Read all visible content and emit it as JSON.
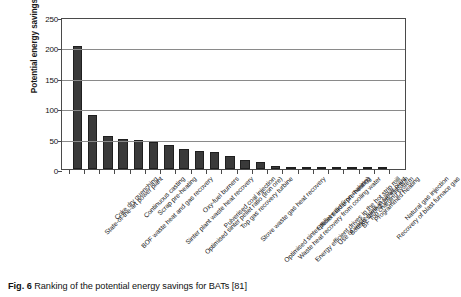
{
  "caption": {
    "figure_number": "Fig. 6",
    "text": "Ranking of the potential energy savings for BATs [81]"
  },
  "chart_data": {
    "type": "bar",
    "title": "",
    "xlabel": "",
    "ylabel": "Potential energy savings, PJ",
    "ylim": [
      0,
      250
    ],
    "yticks": [
      0,
      50,
      100,
      150,
      200,
      250
    ],
    "grid": true,
    "legend": false,
    "bar_color": "#3a3a3a",
    "categories": [
      "State-of-the-art power plant",
      "Coke dry quenching",
      "BOF waste heat and gas recovery",
      "Continuous casting",
      "Scrap pre-heating",
      "Sinter plant waste heat recovery",
      "Optimised sinter pellet ratio (iron ore)",
      "Oxy-fuel burners",
      "Pulverised coal injection",
      "Top gas recovery turbine",
      "Stove waste gas heat recovery",
      "Optimised sinter pellet ratio (iron making)",
      "Waste heat recovery from cooling water",
      "Energy efficient drives in the hot strip mill",
      "Efficient ladle pre-heating",
      "Use of waste fuels in sinter plant",
      "Bottom stirring/gas injection",
      "BF Top charging system",
      "Programmed heating",
      "Recovery of blast furnace gas",
      "Natural gas injection"
    ],
    "values": [
      202,
      89,
      54,
      50,
      48,
      44,
      39,
      33,
      30,
      28,
      21,
      15,
      12,
      5,
      4,
      4,
      4,
      4,
      3,
      2,
      2
    ]
  }
}
